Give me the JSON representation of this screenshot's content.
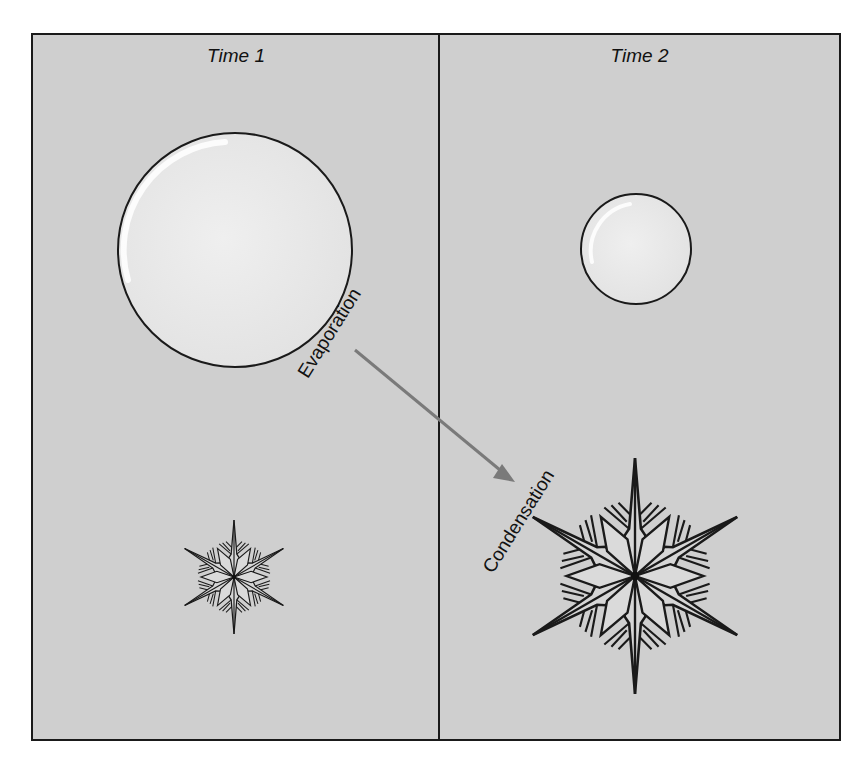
{
  "figure": {
    "panels": [
      {
        "title": "Time 1",
        "droplet": "large water droplet",
        "crystal": "small ice crystal"
      },
      {
        "title": "Time 2",
        "droplet": "small water droplet",
        "crystal": "large ice crystal"
      }
    ],
    "arrow_labels": {
      "evaporation": "Evaporation",
      "condensation": "Condensation"
    },
    "colors": {
      "background": "#cfcfcf",
      "droplet_fill": "#ececec",
      "outline": "#1a1a1a",
      "arrow": "#7a7a7a"
    }
  }
}
